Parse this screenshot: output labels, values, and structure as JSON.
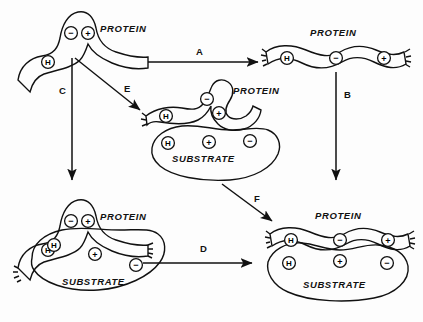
{
  "figure": {
    "background_color": "#fdfdfd",
    "ink_color": "#111111",
    "protein_fill": "#c9c9c4",
    "substrate_fill": "#ffffff",
    "substrate_hatch_color": "#111111"
  },
  "labels": {
    "protein": "PROTEIN",
    "substrate": "SUBSTRATE",
    "charge_minus": "−",
    "charge_plus": "+",
    "charge_h": "H"
  },
  "states": [
    {
      "id": "state-folded-protein",
      "name": "folded-protein",
      "molecule_label": "PROTEIN",
      "groups": [
        "−",
        "+",
        "H"
      ],
      "has_substrate": false,
      "position": "top-left"
    },
    {
      "id": "state-extended-protein",
      "name": "extended-protein",
      "molecule_label": "PROTEIN",
      "groups": [
        "H",
        "−",
        "+"
      ],
      "has_substrate": false,
      "position": "top-right"
    },
    {
      "id": "state-partial-complex",
      "name": "partially-bound-complex",
      "molecule_label": "PROTEIN",
      "substrate_label": "SUBSTRATE",
      "groups": [
        "H",
        "−",
        "+"
      ],
      "substrate_groups": [
        "H",
        "+",
        "−"
      ],
      "has_substrate": true,
      "position": "center"
    },
    {
      "id": "state-folded-complex",
      "name": "folded-protein-on-substrate",
      "molecule_label": "PROTEIN",
      "substrate_label": "SUBSTRATE",
      "groups": [
        "−",
        "+",
        "H"
      ],
      "substrate_groups": [
        "H",
        "+",
        "−"
      ],
      "has_substrate": true,
      "position": "bottom-left"
    },
    {
      "id": "state-full-complex",
      "name": "fully-bound-complex",
      "molecule_label": "PROTEIN",
      "substrate_label": "SUBSTRATE",
      "groups": [
        "H",
        "−",
        "+"
      ],
      "substrate_groups": [
        "H",
        "+",
        "−"
      ],
      "has_substrate": true,
      "position": "bottom-right"
    }
  ],
  "arrows": [
    {
      "id": "arrow-a",
      "label": "A",
      "from": "folded-protein",
      "to": "extended-protein",
      "direction": "right"
    },
    {
      "id": "arrow-b",
      "label": "B",
      "from": "extended-protein",
      "to": "full-complex",
      "direction": "down"
    },
    {
      "id": "arrow-c",
      "label": "C",
      "from": "folded-protein",
      "to": "folded-complex",
      "direction": "down"
    },
    {
      "id": "arrow-d",
      "label": "D",
      "from": "folded-complex",
      "to": "full-complex",
      "direction": "right"
    },
    {
      "id": "arrow-e",
      "label": "E",
      "from": "folded-protein",
      "to": "partial-complex",
      "direction": "down-right"
    },
    {
      "id": "arrow-f",
      "label": "F",
      "from": "partial-complex",
      "to": "full-complex",
      "direction": "down-right"
    }
  ]
}
